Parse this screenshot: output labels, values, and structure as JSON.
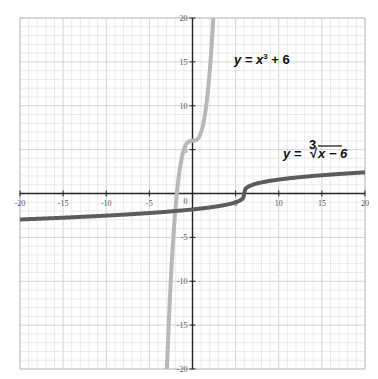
{
  "chart_data": {
    "type": "line",
    "title": "",
    "xlabel": "",
    "ylabel": "",
    "xlim": [
      -20,
      20
    ],
    "ylim": [
      -20,
      20
    ],
    "grid": true,
    "x_ticks": [
      -20,
      -15,
      -10,
      -5,
      0,
      5,
      10,
      15,
      20
    ],
    "y_ticks": [
      -20,
      -15,
      -10,
      -5,
      0,
      5,
      10,
      15,
      20
    ],
    "x_tick_labels": [
      "-20",
      "-15",
      "-10",
      "-5",
      "",
      "5",
      "10",
      "15",
      "20"
    ],
    "y_tick_labels": [
      "-20",
      "-15",
      "-10",
      "-5",
      "0",
      "5",
      "10",
      "15",
      "20"
    ],
    "series": [
      {
        "name": "y = x³ + 6",
        "function": "x^3 + 6",
        "color": "#b8b8b8",
        "line_width": 4,
        "x": [
          -3.0,
          -2.5,
          -2.0,
          -1.5,
          -1.0,
          -0.5,
          0,
          0.5,
          1.0,
          1.5,
          2.0,
          2.4
        ],
        "values": [
          -21,
          -9.63,
          -2,
          2.63,
          5,
          5.88,
          6,
          6.13,
          7,
          9.38,
          14,
          19.82
        ]
      },
      {
        "name": "y = ∛(x − 6)",
        "function": "cbrt(x - 6)",
        "color": "#5c5c5c",
        "line_width": 4,
        "x": [
          -20,
          -15,
          -10,
          -5,
          0,
          5,
          6,
          7,
          10,
          15,
          20
        ],
        "values": [
          -2.96,
          -2.76,
          -2.52,
          -2.22,
          -1.82,
          -1,
          0,
          1,
          1.59,
          2.08,
          2.41
        ]
      }
    ],
    "annotations": [
      {
        "text": "y = x³ + 6",
        "x": 4.3,
        "y": 15.5
      },
      {
        "text": "y = ∛x − 6",
        "x": 11,
        "y": 3.5
      }
    ]
  },
  "labels": {
    "eq1_prefix": "y = x",
    "eq1_sup": "3",
    "eq1_suffix": " + 6",
    "eq2_prefix": "y = ",
    "eq2_index": "3",
    "eq2_radical": "√",
    "eq2_radicand": "x − 6"
  }
}
